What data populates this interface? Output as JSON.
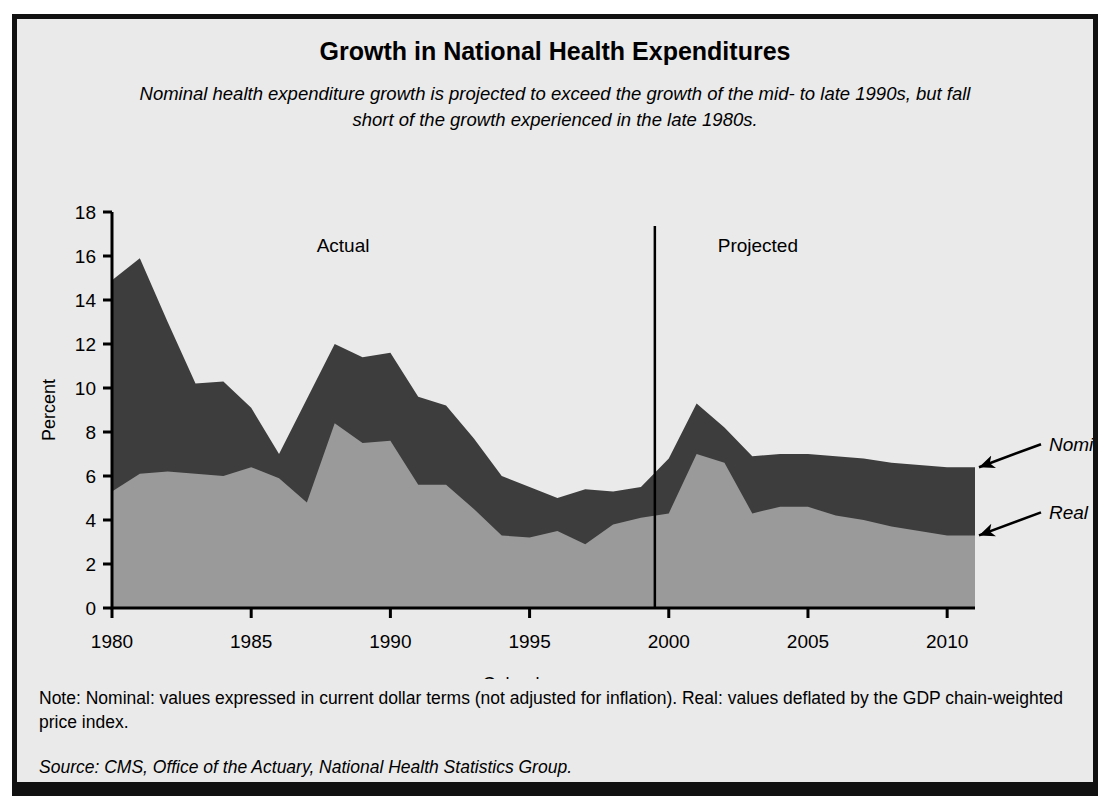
{
  "figure": {
    "title": "Growth in National Health Expenditures",
    "subtitle": "Nominal health expenditure growth is projected to exceed the growth of the mid- to late 1990s, but fall short of the growth experienced in the late 1980s.",
    "note": "Note: Nominal: values expressed in current dollar terms (not adjusted for inflation). Real: values deflated by the GDP chain-weighted price index.",
    "source": "Source: CMS, Office of the Actuary, National Health Statistics Group.",
    "colors": {
      "background": "#eaeaea",
      "frame": "#111111",
      "nominal_band": "#3d3d3d",
      "real_band": "#9a9a9a",
      "axis": "#000000"
    }
  },
  "annotations": {
    "actual_label": "Actual",
    "projected_label": "Projected",
    "nominal_label": "Nominal",
    "real_label": "Real",
    "divider_year": 1999.5
  },
  "chart_data": {
    "type": "area",
    "title": "Growth in National Health Expenditures",
    "subtitle": "Nominal health expenditure growth is projected to exceed the growth of the mid- to late 1990s, but fall short of the growth experienced in the late 1980s.",
    "xlabel": "Calendar years",
    "ylabel": "Percent",
    "xlim": [
      1980,
      2011
    ],
    "ylim": [
      0,
      18
    ],
    "ytick_values": [
      0,
      2,
      4,
      6,
      8,
      10,
      12,
      14,
      16,
      18
    ],
    "ytick_labels": [
      "0",
      "2",
      "4",
      "6",
      "8",
      "10",
      "12",
      "14",
      "16",
      "18"
    ],
    "xtick_values": [
      1980,
      1985,
      1990,
      1995,
      2000,
      2005,
      2010
    ],
    "xtick_labels": [
      "1980",
      "1985",
      "1990",
      "1995",
      "2000",
      "2005",
      "2010"
    ],
    "grid": false,
    "legend": "annotated-arrows-right",
    "stacked": false,
    "x": [
      1980,
      1981,
      1982,
      1983,
      1984,
      1985,
      1986,
      1987,
      1988,
      1989,
      1990,
      1991,
      1992,
      1993,
      1994,
      1995,
      1996,
      1997,
      1998,
      1999,
      2000,
      2001,
      2002,
      2003,
      2004,
      2005,
      2006,
      2007,
      2008,
      2009,
      2010,
      2011
    ],
    "series": [
      {
        "name": "Nominal",
        "color": "#3d3d3d",
        "values": [
          14.9,
          15.9,
          13.0,
          10.2,
          10.3,
          9.1,
          7.0,
          9.5,
          12.0,
          11.4,
          11.6,
          9.6,
          9.2,
          7.7,
          6.0,
          5.5,
          5.0,
          5.4,
          5.3,
          5.5,
          6.8,
          9.3,
          8.2,
          6.9,
          7.0,
          7.0,
          6.9,
          6.8,
          6.6,
          6.5,
          6.4,
          6.4
        ]
      },
      {
        "name": "Real",
        "color": "#9a9a9a",
        "values": [
          5.3,
          6.1,
          6.2,
          6.1,
          6.0,
          6.4,
          5.9,
          4.8,
          8.4,
          7.5,
          7.6,
          5.6,
          5.6,
          4.5,
          3.3,
          3.2,
          3.5,
          2.9,
          3.8,
          4.1,
          4.3,
          7.0,
          6.6,
          4.3,
          4.6,
          4.6,
          4.2,
          4.0,
          3.7,
          3.5,
          3.3,
          3.3
        ]
      }
    ]
  }
}
